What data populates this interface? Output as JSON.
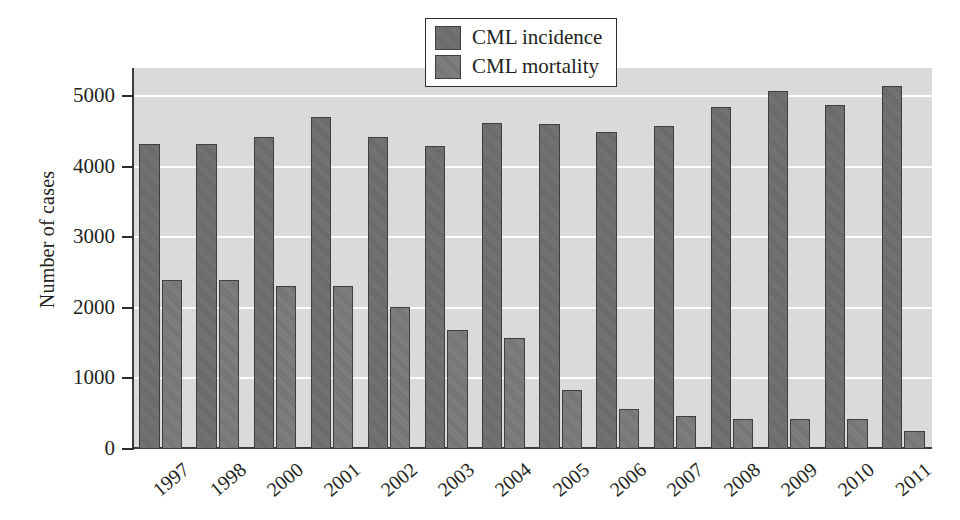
{
  "chart_data": {
    "type": "bar",
    "title": "",
    "xlabel": "",
    "ylabel": "Number of cases",
    "categories": [
      "1997",
      "1998",
      "2000",
      "2001",
      "2002",
      "2003",
      "2004",
      "2005",
      "2006",
      "2007",
      "2008",
      "2009",
      "2010",
      "2011"
    ],
    "series": [
      {
        "name": "CML incidence",
        "color": "#6c6c6c",
        "values": [
          4330,
          4330,
          4420,
          4700,
          4420,
          4300,
          4620,
          4610,
          4500,
          4580,
          4850,
          5070,
          4880,
          5150
        ]
      },
      {
        "name": "CML mortality",
        "color": "#757575",
        "values": [
          2400,
          2400,
          2310,
          2310,
          2010,
          1690,
          1570,
          840,
          570,
          470,
          420,
          420,
          420,
          250
        ]
      }
    ],
    "ylim": [
      0,
      5400
    ],
    "yticks": [
      0,
      1000,
      2000,
      3000,
      4000,
      5000
    ],
    "ytick_labels": [
      "0",
      "1000",
      "2000",
      "3000",
      "4000",
      "5000"
    ],
    "grid": true,
    "grid_color": "#fdfdfd",
    "plot_background": "#d9dada",
    "legend_position": "top-center",
    "legend": [
      "CML incidence",
      "CML mortality"
    ]
  }
}
